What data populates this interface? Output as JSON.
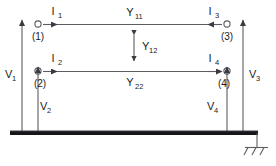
{
  "figure": {
    "type": "two-line-coupled-transmission-line-circuit-diagram",
    "background_color": "#ffffff",
    "line_color": "#55555a",
    "ground_bar_color": "#1a1a1a"
  },
  "currents": [
    {
      "name": "I1",
      "base": "I",
      "sub": "1",
      "direction": "right",
      "at_node": "1"
    },
    {
      "name": "I2",
      "base": "I",
      "sub": "2",
      "direction": "right",
      "at_node": "2"
    },
    {
      "name": "I3",
      "base": "I",
      "sub": "3",
      "direction": "left",
      "at_node": "3"
    },
    {
      "name": "I4",
      "base": "I",
      "sub": "4",
      "direction": "right",
      "at_node": "4"
    }
  ],
  "voltages": [
    {
      "name": "V1",
      "base": "V",
      "sub": "1",
      "direction": "up",
      "side": "left-outer"
    },
    {
      "name": "V2",
      "base": "V",
      "sub": "2",
      "direction": "up",
      "side": "left-inner"
    },
    {
      "name": "V3",
      "base": "V",
      "sub": "3",
      "direction": "up",
      "side": "right-outer"
    },
    {
      "name": "V4",
      "base": "V",
      "sub": "4",
      "direction": "up",
      "side": "right-inner"
    }
  ],
  "admittances": [
    {
      "name": "Y11",
      "base": "Y",
      "sub": "11",
      "position": "above-upper-line"
    },
    {
      "name": "Y12",
      "base": "Y",
      "sub": "12",
      "position": "between-lines",
      "arrow": "double-vertical"
    },
    {
      "name": "Y22",
      "base": "Y",
      "sub": "22",
      "position": "below-lower-line"
    }
  ],
  "nodes": [
    {
      "id": "1",
      "label": "(1)",
      "x": 38,
      "y": 24,
      "line": "upper-left"
    },
    {
      "id": "2",
      "label": "(2)",
      "x": 38,
      "y": 71,
      "line": "lower-left"
    },
    {
      "id": "3",
      "label": "(3)",
      "x": 227,
      "y": 24,
      "line": "upper-right"
    },
    {
      "id": "4",
      "label": "(4)",
      "x": 227,
      "y": 71,
      "line": "lower-right"
    }
  ],
  "ground": {
    "symbol": "ground-hatch",
    "hatch_marks": 3,
    "bar_label": ""
  }
}
